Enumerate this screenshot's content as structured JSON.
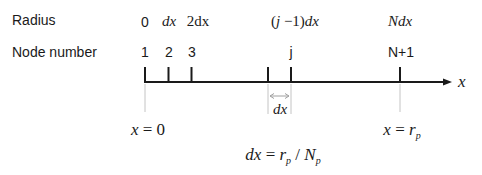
{
  "rows": {
    "radius_label": "Radius",
    "node_label": "Node number"
  },
  "radius_values": {
    "r0": "0",
    "r1": "dx",
    "r2": "2dx",
    "rj_open": "(",
    "rj_j": "j",
    "rj_rest": " −1)",
    "rj_dx": "dx",
    "rN": "Ndx"
  },
  "node_numbers": {
    "n1": "1",
    "n2": "2",
    "n3": "3",
    "nj": "j",
    "nN1": "N+1"
  },
  "axis": {
    "label": "x",
    "spacing_label": "dx"
  },
  "bottom": {
    "left_lhs": "x",
    "left_eq": " = 0",
    "right_lhs": "x",
    "right_eq": " = ",
    "right_r": "r",
    "right_sub": "p",
    "formula_dx": "dx",
    "formula_eq": " = ",
    "formula_r": "r",
    "formula_rsub": "p",
    "formula_slash": " / ",
    "formula_N": "N",
    "formula_Nsub": "p"
  },
  "colors": {
    "axis": "#1a1a1a",
    "guide": "#bdbdbd",
    "dimension": "#9e9e9e"
  }
}
